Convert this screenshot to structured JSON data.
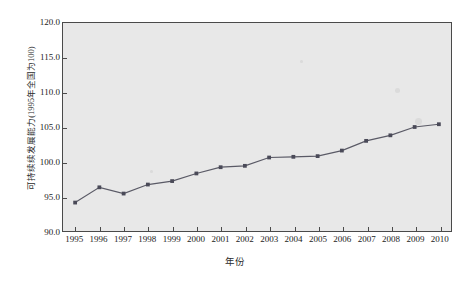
{
  "chart_data": {
    "type": "line",
    "title": "",
    "subtitle": "",
    "xlabel": "年份",
    "ylabel": "可持续续发展能力(1995年全国为100)",
    "categories": [
      "1995",
      "1996",
      "1997",
      "1998",
      "1999",
      "2000",
      "2001",
      "2002",
      "2003",
      "2004",
      "2005",
      "2006",
      "2007",
      "2008",
      "2009",
      "2010"
    ],
    "values": [
      94.1,
      96.3,
      95.4,
      96.7,
      97.2,
      98.3,
      99.2,
      99.4,
      100.6,
      100.7,
      100.8,
      101.6,
      103.0,
      103.8,
      105.0,
      105.4
    ],
    "series": [
      {
        "name": "可持续发展能力",
        "values": [
          94.1,
          96.3,
          95.4,
          96.7,
          97.2,
          98.3,
          99.2,
          99.4,
          100.6,
          100.7,
          100.8,
          101.6,
          103.0,
          103.8,
          105.0,
          105.4
        ]
      }
    ],
    "ylim": [
      90.0,
      120.0
    ],
    "ytick_labels": [
      "120.0",
      "115.0",
      "110.0",
      "105.0",
      "100.0",
      "95.0",
      "90.0"
    ],
    "ytick_values": [
      120.0,
      115.0,
      110.0,
      105.0,
      100.0,
      95.0,
      90.0
    ],
    "xtick_labels": [
      "1995",
      "1996",
      "1997",
      "1998",
      "1999",
      "2000",
      "2001",
      "2002",
      "2003",
      "2004",
      "2005",
      "2006",
      "2007",
      "2008",
      "2009",
      "2010"
    ],
    "grid": false,
    "legend": null,
    "legend_position": "none",
    "colors": {
      "line": "#5a5a66",
      "marker": "#4a4a58",
      "plot_background": "#e8e8e8",
      "axis": "#4a4a4a",
      "text": "#232323",
      "figure_background": "#ffffff"
    }
  }
}
